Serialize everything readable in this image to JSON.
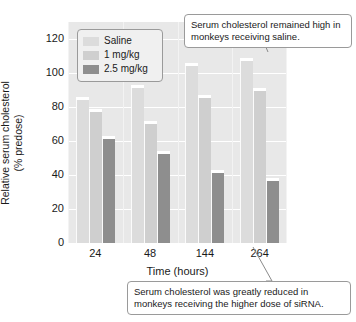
{
  "chart_data": {
    "type": "bar",
    "title": "",
    "xlabel": "Time (hours)",
    "ylabel": "Relative serum cholesterol (% predose)",
    "ylabel_line1": "Relative serum cholesterol",
    "ylabel_line2": "(% predose)",
    "categories": [
      "24",
      "48",
      "144",
      "264"
    ],
    "series": [
      {
        "name": "Saline",
        "color": "#dcdcdc",
        "values": [
          86,
          93,
          106,
          109
        ]
      },
      {
        "name": "1 mg/kg",
        "color": "#cfcfcf",
        "values": [
          79,
          72,
          87,
          91
        ]
      },
      {
        "name": "2.5 mg/kg",
        "color": "#8e8e8e",
        "values": [
          63,
          54,
          43,
          38
        ]
      }
    ],
    "yticks": [
      0,
      20,
      40,
      60,
      80,
      100,
      120
    ],
    "ylim": [
      0,
      130
    ],
    "grid": true,
    "legend_position": "top-left",
    "annotations": [
      "Serum cholesterol remained high in monkeys receiving saline.",
      "Serum cholesterol was greatly reduced in monkeys receiving the higher dose of siRNA."
    ]
  },
  "legend": {
    "items": [
      {
        "label": "Saline"
      },
      {
        "label": "1 mg/kg"
      },
      {
        "label": "2.5 mg/kg"
      }
    ]
  },
  "callouts": {
    "top": "Serum cholesterol remained high in monkeys receiving saline.",
    "bottom": "Serum cholesterol was greatly reduced in monkeys receiving the higher dose of siRNA."
  },
  "colors": {
    "plot_background": "#e8e8e8",
    "gridline": "#ffffff",
    "saline": "#dcdcdc",
    "dose1": "#cfcfcf",
    "dose25": "#8e8e8e",
    "text": "#1a1a1a",
    "callout_border": "#9a9a9a"
  }
}
